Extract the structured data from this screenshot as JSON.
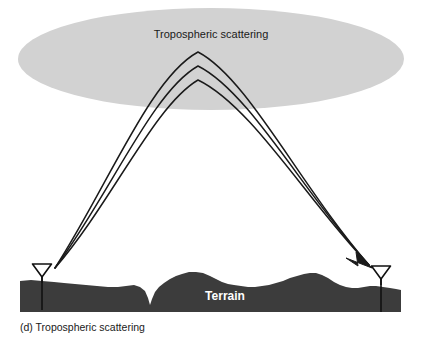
{
  "figure": {
    "title_label": "Tropospheric scattering",
    "terrain_label": "Terrain",
    "caption": "(d) Tropospheric scattering",
    "colors": {
      "background": "#ffffff",
      "troposphere_fill": "#d2d2d2",
      "terrain_fill": "#3c3c3c",
      "ray_stroke": "#1a1a1a",
      "antenna_stroke": "#111111",
      "terrain_label_color": "#ffffff",
      "text_color": "#1a1a1a"
    },
    "troposphere_region": {
      "name": "tropospheric-scattering-volume",
      "shape": "ellipse",
      "center_x": 211,
      "center_y": 59,
      "radius_x": 193,
      "radius_y": 51
    },
    "rays": {
      "count": 3,
      "origin_x": 55,
      "origin_y": 268,
      "destination_x": 369,
      "destination_y": 265,
      "apex_x": 198,
      "apex_heights": [
        52,
        66,
        80
      ]
    },
    "antennas": [
      {
        "name": "antenna-left",
        "role": "transmitter",
        "x": 42,
        "dish_top_y": 264,
        "dish_width": 19,
        "dish_height": 13,
        "mast_bottom_y": 310
      },
      {
        "name": "antenna-right",
        "role": "receiver",
        "x": 381,
        "dish_top_y": 266,
        "dish_width": 19,
        "dish_height": 13,
        "mast_bottom_y": 312
      }
    ],
    "terrain": {
      "name": "terrain-profile",
      "left_x": 20,
      "right_x": 401,
      "baseline_y": 312,
      "label_x": 225,
      "label_y": 296
    },
    "title_position": {
      "x": 211,
      "y": 38
    },
    "caption_position": {
      "x": 20,
      "y": 330
    }
  }
}
